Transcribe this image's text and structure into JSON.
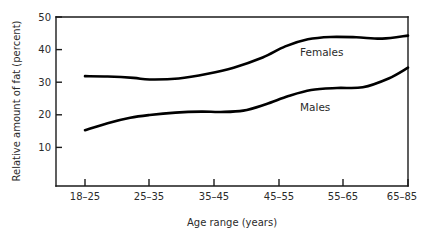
{
  "chart_data": {
    "type": "line",
    "title": "",
    "xlabel": "Age range (years)",
    "ylabel": "Relative amount of fat (percent)",
    "categories": [
      "18-25",
      "25-35",
      "35-45",
      "45-55",
      "55-65",
      "65-85"
    ],
    "x_tick_labels": [
      "18–25",
      "25–35",
      "35–45",
      "45–55",
      "55–65",
      "65–85"
    ],
    "y_tick_labels": [
      "50",
      "40",
      "30",
      "20",
      "10"
    ],
    "y_ticks": [
      50,
      40,
      30,
      20,
      10
    ],
    "ylim": [
      0,
      50
    ],
    "grid": false,
    "legend_position": "inline-labels",
    "series": [
      {
        "name": "Females",
        "label": "Females",
        "color": "#000000",
        "values": [
          32.5,
          31.5,
          35.0,
          42.5,
          43.5,
          44.5
        ],
        "detail_x": [
          0.0,
          0.35,
          0.75,
          1.0,
          1.45,
          1.9,
          2.3,
          2.75,
          3.1,
          3.45,
          3.8,
          4.2,
          4.6,
          5.0
        ],
        "detail_y": [
          32.5,
          32.4,
          32.0,
          31.5,
          31.8,
          33.2,
          35.0,
          38.0,
          41.3,
          43.4,
          44.1,
          44.0,
          43.6,
          44.5
        ]
      },
      {
        "name": "Males",
        "label": "Males",
        "color": "#000000",
        "values": [
          16.5,
          21.0,
          22.0,
          27.5,
          29.0,
          35.0
        ],
        "detail_x": [
          0.0,
          0.35,
          0.7,
          1.0,
          1.4,
          1.8,
          2.1,
          2.45,
          2.8,
          3.15,
          3.5,
          3.9,
          4.3,
          4.7,
          5.0
        ],
        "detail_y": [
          16.5,
          18.6,
          20.2,
          21.0,
          21.7,
          22.0,
          21.9,
          22.3,
          24.2,
          26.6,
          28.4,
          29.0,
          29.2,
          31.8,
          35.0
        ]
      }
    ],
    "annotations": [
      {
        "text": "Females",
        "x_cat_index": 3.35,
        "y_value": 39.0
      },
      {
        "text": "Males",
        "x_cat_index": 3.35,
        "y_value": 24.5
      }
    ]
  }
}
